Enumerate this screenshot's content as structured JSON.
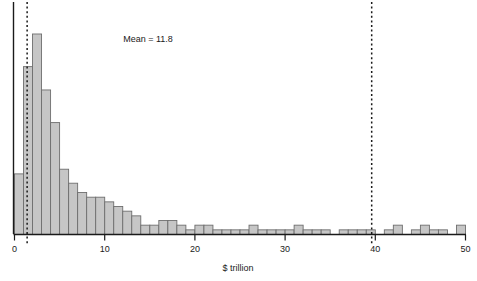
{
  "chart_data": {
    "type": "bar",
    "title": "",
    "subtitle": "",
    "xlabel": "$ trillion",
    "ylabel": "",
    "xlim": [
      0,
      50
    ],
    "ylim": [
      0,
      46
    ],
    "grid": false,
    "legend_position": "none",
    "bin_width": 1,
    "xticks": [
      0,
      10,
      20,
      30,
      40,
      50
    ],
    "xtick_labels": [
      "0",
      "10",
      "20",
      "30",
      "40",
      "50"
    ],
    "categories": [
      "0-1",
      "1-2",
      "2-3",
      "3-4",
      "4-5",
      "5-6",
      "6-7",
      "7-8",
      "8-9",
      "9-10",
      "10-11",
      "11-12",
      "12-13",
      "13-14",
      "14-15",
      "15-16",
      "16-17",
      "17-18",
      "18-19",
      "19-20",
      "20-21",
      "21-22",
      "22-23",
      "23-24",
      "24-25",
      "25-26",
      "26-27",
      "27-28",
      "28-29",
      "29-30",
      "30-31",
      "31-32",
      "32-33",
      "33-34",
      "34-35",
      "35-36",
      "36-37",
      "37-38",
      "38-39",
      "39-40",
      "40-41",
      "41-42",
      "42-43",
      "43-44",
      "44-45",
      "45-46",
      "46-47",
      "47-48",
      "48-49",
      "49-50"
    ],
    "values": [
      13,
      36,
      43,
      31,
      24,
      14,
      11,
      9,
      8,
      8,
      7,
      6,
      5,
      4,
      2,
      2,
      3,
      3,
      2,
      1,
      2,
      2,
      1,
      1,
      1,
      1,
      2,
      1,
      1,
      1,
      1,
      2,
      1,
      1,
      1,
      0,
      1,
      1,
      1,
      1,
      0,
      1,
      2,
      0,
      1,
      2,
      1,
      1,
      0,
      2
    ],
    "annotations": [
      {
        "name": "mean-label",
        "text": "Mean = 11.8",
        "x": 20.5,
        "y": 40
      }
    ],
    "reference_lines": [
      {
        "name": "median-line",
        "x": 1.4,
        "style": "dashed",
        "color": "#1a1a1a"
      },
      {
        "name": "upper-line",
        "x": 39.6,
        "style": "dashed",
        "color": "#1a1a1a"
      }
    ],
    "colors": {
      "bar_fill": "#c6c6c6",
      "bar_stroke": "#6e6e6e",
      "axis": "#1a1a1a",
      "text": "#1a1a1a",
      "background": "#ffffff"
    }
  },
  "axes": {
    "y_axis_name": "y-axis-line",
    "x_axis_name": "x-axis-line"
  }
}
